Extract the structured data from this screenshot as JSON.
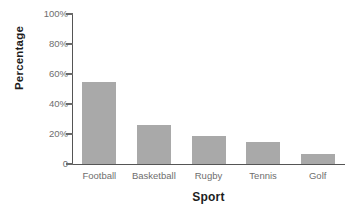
{
  "chart_data": {
    "type": "bar",
    "title": "",
    "subtitle": "",
    "categories": [
      "Football",
      "Basketball",
      "Rugby",
      "Tennis",
      "Golf"
    ],
    "values": [
      55,
      26,
      19,
      15,
      7
    ],
    "xlabel": "Sport",
    "ylabel": "Percentage",
    "ylim": [
      0,
      100
    ],
    "ytick_values": [
      0,
      20,
      40,
      60,
      80,
      100
    ],
    "ytick_labels": [
      "0",
      "20%",
      "40%",
      "60%",
      "80%",
      "100%"
    ],
    "grid": false,
    "legend": null,
    "legend_position": "none",
    "annotations": [],
    "series": [
      {
        "name": "Percentage",
        "values": [
          55,
          26,
          19,
          15,
          7
        ],
        "color": "#a9a9a9"
      }
    ],
    "colors": {
      "bar_fill": "#a9a9a9",
      "axis_line": "#555555",
      "tick_label": "#6e6e6e",
      "axis_title": "#1d1d1d",
      "background": "#ffffff"
    }
  }
}
